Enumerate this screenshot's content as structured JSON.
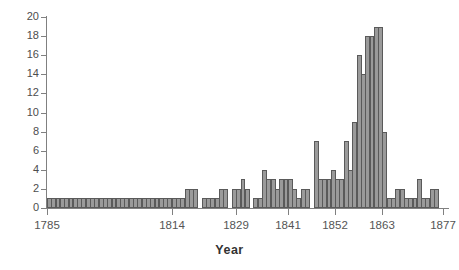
{
  "chart_data": {
    "type": "bar",
    "title": "",
    "xlabel": "Year",
    "ylabel": "",
    "ylim": [
      0,
      20
    ],
    "ytick_step": 2,
    "yticks": [
      0,
      2,
      4,
      6,
      8,
      10,
      12,
      14,
      16,
      18,
      20
    ],
    "xtick_labels": [
      "1785",
      "1814",
      "1829",
      "1841",
      "1852",
      "1863",
      "1877"
    ],
    "xtick_values": [
      1785,
      1814,
      1829,
      1841,
      1852,
      1863,
      1877
    ],
    "xlim": [
      1785,
      1878
    ],
    "grid": false,
    "legend": false,
    "bar_color": "#9a9a9a",
    "bar_edge_color": "#5a5a5a",
    "axis_color": "#808080",
    "text_color": "#555555",
    "categories": [
      1785,
      1786,
      1787,
      1788,
      1789,
      1790,
      1791,
      1792,
      1793,
      1794,
      1795,
      1796,
      1797,
      1798,
      1799,
      1800,
      1801,
      1802,
      1803,
      1804,
      1805,
      1806,
      1807,
      1808,
      1809,
      1810,
      1811,
      1812,
      1813,
      1814,
      1815,
      1816,
      1817,
      1818,
      1819,
      1820,
      1821,
      1822,
      1823,
      1824,
      1825,
      1826,
      1827,
      1828,
      1829,
      1830,
      1831,
      1832,
      1833,
      1834,
      1835,
      1836,
      1837,
      1838,
      1839,
      1840,
      1841,
      1842,
      1843,
      1844,
      1845,
      1846,
      1847,
      1848,
      1849,
      1850,
      1851,
      1852,
      1853,
      1854,
      1855,
      1856,
      1857,
      1858,
      1859,
      1860,
      1861,
      1862,
      1863,
      1864,
      1865,
      1866,
      1867,
      1868,
      1869,
      1870,
      1871,
      1872,
      1873,
      1874,
      1875,
      1876,
      1877
    ],
    "values": [
      1,
      1,
      1,
      1,
      1,
      1,
      1,
      1,
      1,
      1,
      1,
      1,
      1,
      1,
      1,
      1,
      1,
      1,
      1,
      1,
      1,
      1,
      1,
      1,
      1,
      1,
      1,
      1,
      1,
      1,
      1,
      1,
      2,
      2,
      2,
      0,
      1,
      1,
      1,
      1,
      2,
      2,
      0,
      2,
      2,
      3,
      2,
      0,
      1,
      1,
      4,
      3,
      3,
      2,
      3,
      3,
      3,
      2,
      1,
      2,
      2,
      0,
      7,
      3,
      3,
      3,
      4,
      3,
      3,
      7,
      4,
      9,
      16,
      14,
      18,
      18,
      19,
      19,
      8,
      1,
      1,
      2,
      2,
      1,
      1,
      1,
      3,
      1,
      1,
      2,
      2,
      0,
      0
    ]
  }
}
